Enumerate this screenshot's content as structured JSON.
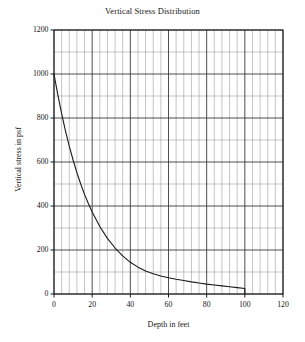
{
  "chart_data": {
    "type": "line",
    "title": "Vertical Stress Distribution",
    "xlabel": "Depth in feet",
    "ylabel": "Vertical stress in psf",
    "xlim": [
      0,
      120
    ],
    "ylim": [
      0,
      1200
    ],
    "xticks": [
      0,
      20,
      40,
      60,
      80,
      100,
      120
    ],
    "yticks": [
      0,
      200,
      400,
      600,
      800,
      1000,
      1200
    ],
    "x_minor_step": 4,
    "y_minor_step": 100,
    "grid": true,
    "legend": null,
    "line_color": "#1a1a1a",
    "grid_color": "#8a8a8a",
    "x": [
      0,
      2,
      4,
      6,
      8,
      10,
      12,
      14,
      16,
      18,
      20,
      24,
      28,
      32,
      36,
      40,
      44,
      48,
      52,
      56,
      60,
      64,
      68,
      72,
      76,
      80,
      84,
      88,
      92,
      96,
      100
    ],
    "y": [
      1000,
      905,
      820,
      742,
      672,
      609,
      552,
      500,
      453,
      411,
      373,
      307,
      253,
      209,
      173,
      144,
      122,
      105,
      92,
      82,
      74,
      67,
      61,
      55,
      50,
      45,
      41,
      37,
      33,
      29,
      25
    ],
    "series": [
      {
        "name": "Vertical stress",
        "values": [
          1000,
          905,
          820,
          742,
          672,
          609,
          552,
          500,
          453,
          411,
          373,
          307,
          253,
          209,
          173,
          144,
          122,
          105,
          92,
          82,
          74,
          67,
          61,
          55,
          50,
          45,
          41,
          37,
          33,
          29,
          25
        ]
      }
    ],
    "terminus_drop": {
      "x": 100,
      "from": 25,
      "to": 0
    }
  }
}
